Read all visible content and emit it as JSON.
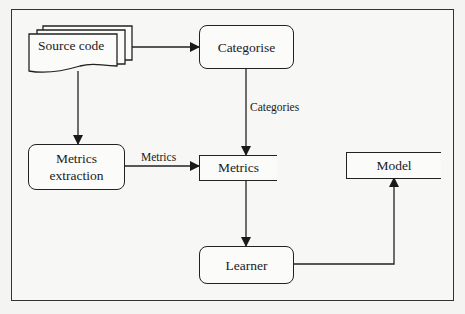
{
  "diagram": {
    "nodes": {
      "source_code": "Source code",
      "categorise": "Categorise",
      "metrics_extraction": "Metrics extraction",
      "metrics_store": "Metrics",
      "learner": "Learner",
      "model": "Model"
    },
    "edges": [
      {
        "from": "source_code",
        "to": "categorise",
        "label": ""
      },
      {
        "from": "source_code",
        "to": "metrics_extraction",
        "label": ""
      },
      {
        "from": "categorise",
        "to": "metrics_store",
        "label": "Categories"
      },
      {
        "from": "metrics_extraction",
        "to": "metrics_store",
        "label": "Metrics"
      },
      {
        "from": "metrics_store",
        "to": "learner",
        "label": ""
      },
      {
        "from": "learner",
        "to": "model",
        "label": ""
      }
    ],
    "edge_labels": {
      "categories": "Categories",
      "metrics": "Metrics"
    }
  },
  "colors": {
    "stroke": "#222222",
    "background": "#f4f4f2"
  }
}
